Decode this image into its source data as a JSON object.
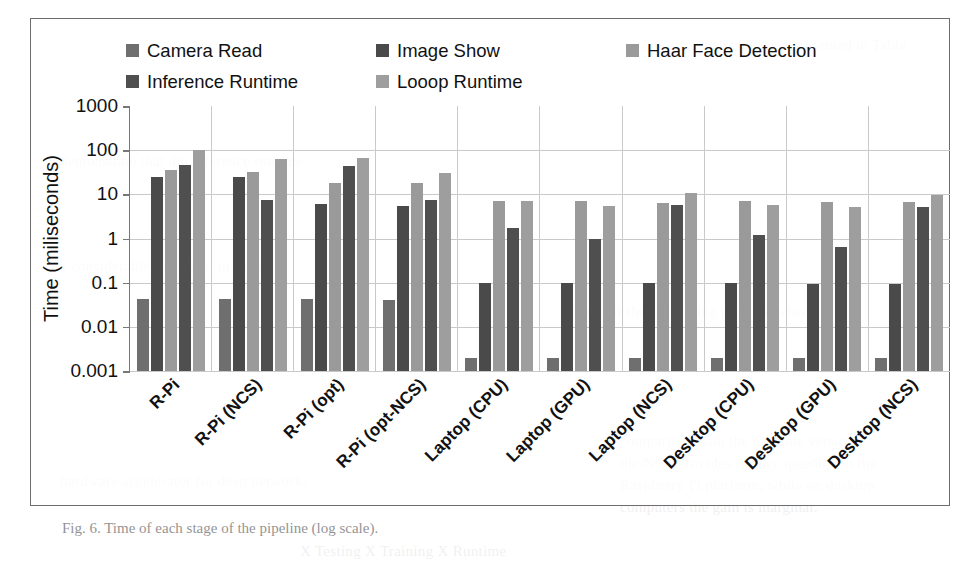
{
  "chart_data": {
    "type": "bar",
    "title": "",
    "subtitle": "",
    "xlabel": "",
    "ylabel": "Time (miliseconds)",
    "scale": "log",
    "ylim": [
      0.001,
      1000
    ],
    "ytick_labels": [
      "1000",
      "100",
      "10",
      "1",
      "0.1",
      "0.01",
      "0.001"
    ],
    "ytick_values": [
      1000,
      100,
      10,
      1,
      0.1,
      0.01,
      0.001
    ],
    "grid": true,
    "legend_position": "top",
    "categories": [
      "R-Pi",
      "R-Pi (NCS)",
      "R-Pi (opt)",
      "R-Pi (opt-NCS)",
      "Laptop (CPU)",
      "Laptop (GPU)",
      "Laptop (NCS)",
      "Desktop (CPU)",
      "Desktop (GPU)",
      "Desktop (NCS)"
    ],
    "series": [
      {
        "name": "Camera Read",
        "color": "#6f6f6f",
        "values": [
          0.042,
          0.042,
          0.042,
          0.04,
          0.002,
          0.002,
          0.002,
          0.002,
          0.002,
          0.002
        ]
      },
      {
        "name": "Image Show",
        "color": "#4a4a4a",
        "values": [
          25,
          25,
          6,
          5.5,
          0.1,
          0.1,
          0.1,
          0.1,
          0.095,
          0.095
        ]
      },
      {
        "name": "Haar Face Detection",
        "color": "#9a9a9a",
        "values": [
          35,
          32,
          18,
          18,
          7,
          7,
          6.5,
          7,
          6.8,
          6.6
        ]
      },
      {
        "name": "Inference Runtime",
        "color": "#4f4f4f",
        "values": [
          45,
          7.5,
          43,
          7.5,
          1.7,
          0.95,
          5.8,
          1.2,
          0.65,
          5.2
        ]
      },
      {
        "name": "Looop Runtime",
        "color": "#9e9e9e",
        "values": [
          100,
          62,
          68,
          30,
          7,
          5.5,
          10.5,
          5.8,
          5.2,
          9.6
        ]
      }
    ]
  },
  "figure": {
    "caption": "Fig. 6.  Time of each stage of the pipeline (log scale)."
  },
  "page_bleed": {
    "lines": [
      "the results are presented in Table",
      "demonstrate that the inference runtime",
      "a considerable reduction in the total",
      "latency of the processing pipeline when",
      "X  Testing   X   Training   X   Runtime",
      "comparison with the baseline version.",
      "the NCS provides further speedup on the",
      "Raspberry Pi platform, while on desktop",
      "computers the gain is marginal.",
      "hardware accelerator for deep networks"
    ]
  }
}
